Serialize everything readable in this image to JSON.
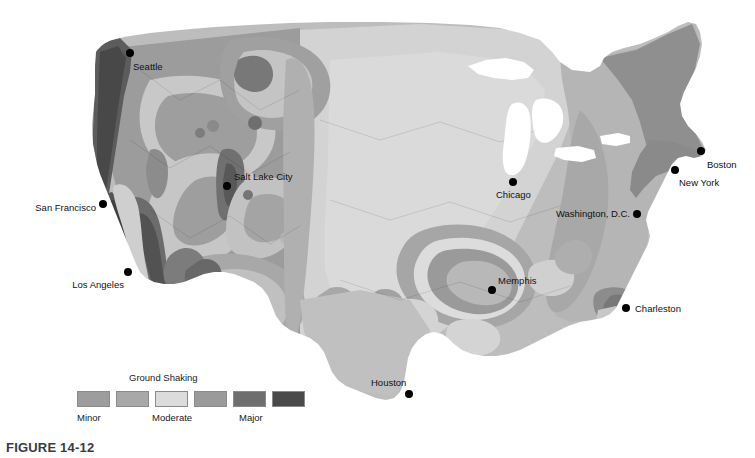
{
  "figure": {
    "caption": "FIGURE 14-12",
    "map_title": "Seismic Hazard Map of the United States"
  },
  "legend": {
    "title": "Ground Shaking",
    "scale_labels": {
      "low": "Minor",
      "mid": "Moderate",
      "high": "Major"
    },
    "swatches": [
      {
        "name": "minor-1",
        "color": "#9d9d9d"
      },
      {
        "name": "minor-2",
        "color": "#a8a8a8"
      },
      {
        "name": "moderate",
        "color": "#dcdcdc"
      },
      {
        "name": "moderate-high",
        "color": "#9a9a9a"
      },
      {
        "name": "major-1",
        "color": "#6e6e6e"
      },
      {
        "name": "major-2",
        "color": "#4a4a4a"
      }
    ]
  },
  "map": {
    "background": "#ffffff",
    "base_land": "#bcbcbc",
    "shading_levels": {
      "level1_lightest": "#dcdcdc",
      "level2_light": "#c6c6c6",
      "level3_base": "#b0b0b0",
      "level4_medium": "#9a9a9a",
      "level5_dark": "#6e6e6e",
      "level6_darkest": "#4a4a4a"
    },
    "cities": [
      {
        "name": "Seattle",
        "label": "Seattle",
        "label_x": 133,
        "label_y": 70,
        "dot_x": 130,
        "dot_y": 53,
        "anchor": "start"
      },
      {
        "name": "San Francisco",
        "label": "San Francisco",
        "label_x": 96,
        "label_y": 211,
        "dot_x": 103,
        "dot_y": 204,
        "anchor": "end"
      },
      {
        "name": "Los Angeles",
        "label": "Los Angeles",
        "label_x": 124,
        "label_y": 288,
        "dot_x": 128,
        "dot_y": 272,
        "anchor": "end"
      },
      {
        "name": "Salt Lake City",
        "label": "Salt Lake City",
        "label_x": 234,
        "label_y": 180,
        "dot_x": 227,
        "dot_y": 186,
        "anchor": "start"
      },
      {
        "name": "Houston",
        "label": "Houston",
        "label_x": 371,
        "label_y": 386,
        "dot_x": 409,
        "dot_y": 394,
        "anchor": "start"
      },
      {
        "name": "Memphis",
        "label": "Memphis",
        "label_x": 498,
        "label_y": 284,
        "dot_x": 492,
        "dot_y": 290,
        "anchor": "start"
      },
      {
        "name": "Chicago",
        "label": "Chicago",
        "label_x": 496,
        "label_y": 198,
        "dot_x": 513,
        "dot_y": 182,
        "anchor": "start"
      },
      {
        "name": "Washington, D.C.",
        "label": "Washington, D.C.",
        "label_x": 630,
        "label_y": 217,
        "dot_x": 637,
        "dot_y": 214,
        "anchor": "end"
      },
      {
        "name": "New York",
        "label": "New York",
        "label_x": 679,
        "label_y": 186,
        "dot_x": 675,
        "dot_y": 170,
        "anchor": "start"
      },
      {
        "name": "Boston",
        "label": "Boston",
        "label_x": 707,
        "label_y": 168,
        "dot_x": 701,
        "dot_y": 151,
        "anchor": "start"
      },
      {
        "name": "Charleston",
        "label": "Charleston",
        "label_x": 635,
        "label_y": 312,
        "dot_x": 626,
        "dot_y": 308,
        "anchor": "start"
      }
    ]
  }
}
